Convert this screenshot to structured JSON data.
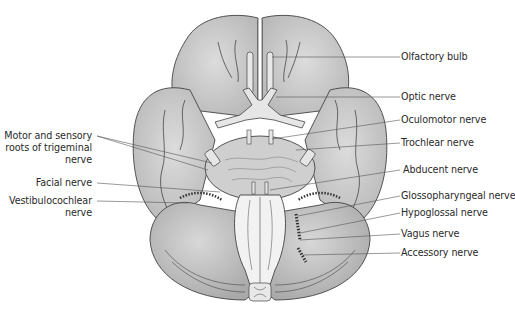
{
  "colors": {
    "brain_fill": "#c8c8c8",
    "brain_shade": "#b4b4b4",
    "brainstem_fill": "#efefef",
    "outline": "#444444",
    "leader_line": "#555555",
    "text": "#2a2a2a"
  },
  "labels_right": [
    {
      "id": "olfactory",
      "text": "Olfactory bulb"
    },
    {
      "id": "optic",
      "text": "Optic nerve"
    },
    {
      "id": "oculomotor",
      "text": "Oculomotor nerve"
    },
    {
      "id": "trochlear",
      "text": "Trochlear nerve"
    },
    {
      "id": "abducent",
      "text": "Abducent nerve"
    },
    {
      "id": "glossopharyngeal",
      "text": "Glossopharyngeal nerve"
    },
    {
      "id": "hypoglossal",
      "text": "Hypoglossal nerve"
    },
    {
      "id": "vagus",
      "text": "Vagus nerve"
    },
    {
      "id": "accessory",
      "text": "Accessory nerve"
    }
  ],
  "labels_left": [
    {
      "id": "trigeminal",
      "lines": [
        "Motor and sensory",
        "roots of trigeminal",
        "nerve"
      ]
    },
    {
      "id": "facial",
      "lines": [
        "Facial nerve"
      ]
    },
    {
      "id": "vestibulocochlear",
      "lines": [
        "Vestibulocochlear",
        "nerve"
      ]
    }
  ]
}
